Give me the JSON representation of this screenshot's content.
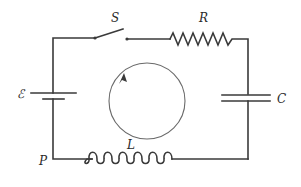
{
  "diagram": {
    "type": "RLC series circuit",
    "components": {
      "switch": {
        "label": "S"
      },
      "resistor": {
        "label": "R"
      },
      "capacitor": {
        "label": "C"
      },
      "inductor": {
        "label": "L"
      },
      "emf": {
        "label": "ℰ"
      },
      "point": {
        "label": "P"
      }
    },
    "loop_direction": "clockwise",
    "colors": {
      "wire": "#3a3a3a",
      "loop": "#6a6a6a",
      "background": "#ffffff"
    }
  }
}
